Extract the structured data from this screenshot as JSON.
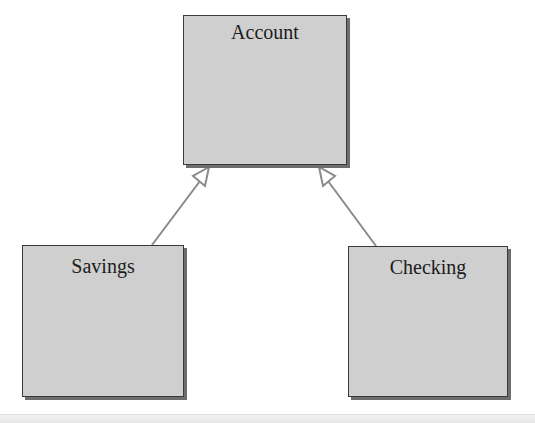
{
  "diagram": {
    "type": "uml-class-inheritance",
    "classes": [
      {
        "id": "account",
        "name": "Account"
      },
      {
        "id": "savings",
        "name": "Savings"
      },
      {
        "id": "checking",
        "name": "Checking"
      }
    ],
    "relationships": [
      {
        "from": "Savings",
        "to": "Account",
        "kind": "generalization",
        "arrowhead": "hollow-triangle"
      },
      {
        "from": "Checking",
        "to": "Account",
        "kind": "generalization",
        "arrowhead": "hollow-triangle"
      }
    ],
    "colors": {
      "box_fill": "#cfcfcf",
      "box_border": "#3a3a3a",
      "box_shadow": "#6d6d6d",
      "connector": "#8a8a8a",
      "text": "#1c1c1c",
      "background": "#ffffff"
    }
  }
}
